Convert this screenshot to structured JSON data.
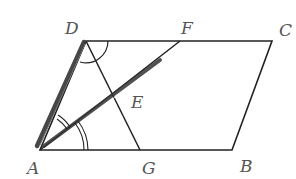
{
  "figure": {
    "type": "parallelogram geometry diagram",
    "points": {
      "A": {
        "label": "A",
        "x": 40,
        "y": 150
      },
      "B": {
        "label": "B",
        "x": 232,
        "y": 150
      },
      "C": {
        "label": "C",
        "x": 272,
        "y": 41
      },
      "D": {
        "label": "D",
        "x": 86,
        "y": 41
      },
      "E": {
        "label": "E",
        "x": 127,
        "y": 96
      },
      "F": {
        "label": "F",
        "x": 180,
        "y": 41
      },
      "G": {
        "label": "G",
        "x": 140,
        "y": 150
      }
    },
    "segments": [
      "AB",
      "BC",
      "CD",
      "DA",
      "AF",
      "DG"
    ],
    "angle_marks": [
      {
        "vertex": "D",
        "between": [
          "DA",
          "DC"
        ],
        "arcs": 1
      },
      {
        "vertex": "A",
        "between": [
          "AF",
          "AB"
        ],
        "arcs": 2
      },
      {
        "vertex": "A",
        "between": [
          "AD",
          "AF"
        ],
        "arcs": 2
      }
    ],
    "stroke_color": "#222222",
    "label_color": "#555555"
  }
}
